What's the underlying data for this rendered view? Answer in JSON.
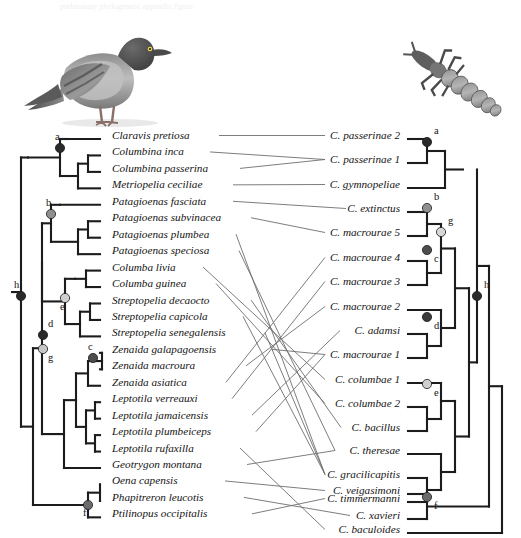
{
  "figure": {
    "type": "tanglegram",
    "title": "",
    "host_images": [
      {
        "name": "pigeon-photo",
        "alt": "Rock pigeon (Columba livia) photograph",
        "x": 22,
        "y": 14,
        "w": 170,
        "h": 112
      },
      {
        "name": "louse-photo",
        "alt": "Chewing louse (Columbicola) photograph",
        "x": 398,
        "y": 40,
        "w": 118,
        "h": 92
      }
    ],
    "ghost_text": "preliminary phylogenetic appendix figure"
  },
  "host_tree": {
    "name": "pigeon-host-tree",
    "tip_labels": [
      "Claravis pretiosa",
      "Columbina inca",
      "Columbina passerina",
      "Metriopelia ceciliae",
      "Patagioenas fasciata",
      "Patagioenas subvinacea",
      "Patagioenas plumbea",
      "Patagioenas speciosa",
      "Columba livia",
      "Columba guinea",
      "Streptopelia decaocto",
      "Streptopelia capicola",
      "Streptopelia senegalensis",
      "Zenaida galapagoensis",
      "Zenaida macroura",
      "Zenaida asiatica",
      "Leptotila verreauxi",
      "Leptotila jamaicensis",
      "Leptotila plumbeiceps",
      "Leptotila rufaxilla",
      "Geotrygon montana",
      "Oena capensis",
      "Phapitreron leucotis",
      "Ptilinopus occipitalis"
    ],
    "node_labels": [
      {
        "id": "a",
        "label": "a",
        "fill": "#2a2a2a",
        "x": 60,
        "y": 148,
        "lx": 55,
        "ly": 140
      },
      {
        "id": "b",
        "label": "b",
        "fill": "#8f8f8f",
        "x": 51,
        "y": 214,
        "lx": 46,
        "ly": 206
      },
      {
        "id": "e",
        "label": "e",
        "fill": "#d0d0d0",
        "x": 65,
        "y": 298,
        "lx": 60,
        "ly": 310
      },
      {
        "id": "d",
        "label": "d",
        "fill": "#2a2a2a",
        "x": 43,
        "y": 335,
        "lx": 48,
        "ly": 327
      },
      {
        "id": "g",
        "label": "g",
        "fill": "#c6c6c6",
        "x": 43,
        "y": 349,
        "lx": 48,
        "ly": 361
      },
      {
        "id": "c",
        "label": "c",
        "fill": "#4d4d4d",
        "x": 93,
        "y": 358,
        "lx": 88,
        "ly": 350
      },
      {
        "id": "f",
        "label": "f",
        "fill": "#6b6b6b",
        "x": 88,
        "y": 505,
        "lx": 83,
        "ly": 516
      },
      {
        "id": "h",
        "label": "h",
        "fill": "#2a2a2a",
        "x": 21,
        "y": 296,
        "lx": 14,
        "ly": 288
      }
    ]
  },
  "parasite_tree": {
    "name": "louse-parasite-tree",
    "tip_labels": [
      "C. passerinae 2",
      "C. passerinae 1",
      "C. gymnopeliae",
      "C. extinctus",
      "C. macrourae 5",
      "C. macrourae 4",
      "C. macrourae 3",
      "C. macrourae 2",
      "C. adamsi",
      "C. macrourae 1",
      "C. columbae 1",
      "C. columbae 2",
      "C. bacillus",
      "C. theresae",
      "C. gracilicapitis",
      "C. timmermanni",
      "C. veigasimoni",
      "C. xavieri",
      "C. baculoides"
    ],
    "node_labels": [
      {
        "id": "a",
        "label": "a",
        "fill": "#2a2a2a",
        "x": 427,
        "y": 142,
        "lx": 434,
        "ly": 134
      },
      {
        "id": "b",
        "label": "b",
        "fill": "#8f8f8f",
        "x": 427,
        "y": 208,
        "lx": 434,
        "ly": 200
      },
      {
        "id": "g",
        "label": "g",
        "fill": "#d6d6d6",
        "x": 441,
        "y": 232,
        "lx": 448,
        "ly": 224
      },
      {
        "id": "c",
        "label": "c",
        "fill": "#4d4d4d",
        "x": 427,
        "y": 250,
        "lx": 434,
        "ly": 262
      },
      {
        "id": "d",
        "label": "d",
        "fill": "#3a3a3a",
        "x": 427,
        "y": 317,
        "lx": 434,
        "ly": 329
      },
      {
        "id": "e",
        "label": "e",
        "fill": "#cfcfcf",
        "x": 427,
        "y": 384,
        "lx": 434,
        "ly": 396
      },
      {
        "id": "f",
        "label": "f",
        "fill": "#6b6b6b",
        "x": 427,
        "y": 497,
        "lx": 434,
        "ly": 509
      },
      {
        "id": "h",
        "label": "h",
        "fill": "#2a2a2a",
        "x": 477,
        "y": 296,
        "lx": 484,
        "ly": 288
      }
    ]
  },
  "associations": [
    {
      "host": "Claravis pretiosa",
      "parasite": "C. passerinae 2"
    },
    {
      "host": "Columbina inca",
      "parasite": "C. passerinae 1"
    },
    {
      "host": "Columbina passerina",
      "parasite": "C. passerinae 1"
    },
    {
      "host": "Metriopelia ceciliae",
      "parasite": "C. gymnopeliae"
    },
    {
      "host": "Patagioenas fasciata",
      "parasite": "C. extinctus"
    },
    {
      "host": "Patagioenas subvinacea",
      "parasite": "C. macrourae 5"
    },
    {
      "host": "Patagioenas plumbea",
      "parasite": "C. gracilicapitis"
    },
    {
      "host": "Patagioenas speciosa",
      "parasite": "C. theresae"
    },
    {
      "host": "Columba livia",
      "parasite": "C. columbae 1"
    },
    {
      "host": "Columba guinea",
      "parasite": "C. columbae 2"
    },
    {
      "host": "Streptopelia decaocto",
      "parasite": "C. bacillus"
    },
    {
      "host": "Streptopelia capicola",
      "parasite": "C. gracilicapitis"
    },
    {
      "host": "Streptopelia senegalensis",
      "parasite": "C. gracilicapitis"
    },
    {
      "host": "Zenaida galapagoensis",
      "parasite": "C. macrourae 1"
    },
    {
      "host": "Zenaida macroura",
      "parasite": "C. macrourae 2"
    },
    {
      "host": "Zenaida asiatica",
      "parasite": "C. macrourae 4"
    },
    {
      "host": "Leptotila verreauxi",
      "parasite": "C. macrourae 3"
    },
    {
      "host": "Leptotila jamaicensis",
      "parasite": "C. adamsi"
    },
    {
      "host": "Leptotila plumbeiceps",
      "parasite": "C. macrourae 1"
    },
    {
      "host": "Leptotila rufaxilla",
      "parasite": "C. baculoides"
    },
    {
      "host": "Geotrygon montana",
      "parasite": "C. theresae"
    },
    {
      "host": "Oena capensis",
      "parasite": "C. veigasimoni"
    },
    {
      "host": "Phapitreron leucotis",
      "parasite": "C. xavieri"
    },
    {
      "host": "Ptilinopus occipitalis",
      "parasite": "C. timmermanni"
    }
  ],
  "colors": {
    "branch": "#1c1c1c",
    "link": "#6e6e6e",
    "text": "#141414",
    "background": "#ffffff"
  }
}
